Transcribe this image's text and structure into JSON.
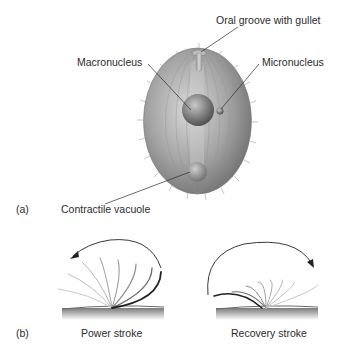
{
  "figure": {
    "panel_a": {
      "tag": "(a)",
      "labels": {
        "oral_groove": "Oral groove with gullet",
        "macronucleus": "Macronucleus",
        "micronucleus": "Micronucleus",
        "contractile_vacuole": "Contractile vacuole"
      }
    },
    "panel_b": {
      "tag": "(b)",
      "power_stroke": "Power stroke",
      "recovery_stroke": "Recovery stroke"
    },
    "colors": {
      "cell_body": "#9a9a9a",
      "line": "#2b2b2b",
      "surface": "#8c8c8c"
    }
  }
}
